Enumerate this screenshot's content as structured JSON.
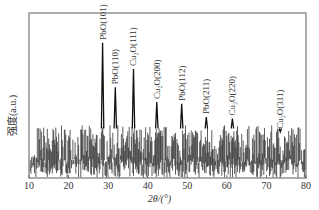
{
  "chart_data": {
    "type": "line",
    "title": "",
    "xlabel": "2θ/(°)",
    "ylabel": "强度(a.u.)",
    "xlim": [
      10,
      80
    ],
    "x_ticks": [
      10,
      20,
      30,
      40,
      50,
      60,
      70,
      80
    ],
    "y_ticks": [],
    "grid": false,
    "legend": "none",
    "series": [
      {
        "name": "XRD pattern",
        "color": "#1a1a1a"
      }
    ],
    "peaks": [
      {
        "label": "PbO(101)",
        "x": 28.6,
        "rel_intensity": 0.82
      },
      {
        "label": "PbO(110)",
        "x": 31.8,
        "rel_intensity": 0.55
      },
      {
        "label": "Cu2O(111)",
        "x": 36.4,
        "rel_intensity": 0.66
      },
      {
        "label": "Cu2O(200)",
        "x": 42.3,
        "rel_intensity": 0.46
      },
      {
        "label": "PbO(112)",
        "x": 48.6,
        "rel_intensity": 0.45
      },
      {
        "label": "PbO(211)",
        "x": 54.8,
        "rel_intensity": 0.37
      },
      {
        "label": "Cu2O(220)",
        "x": 61.4,
        "rel_intensity": 0.36
      },
      {
        "label": "Cu2O(311)",
        "x": 73.5,
        "rel_intensity": 0.28
      }
    ],
    "noise_band": {
      "min_rel": 0.0,
      "max_rel": 0.32
    }
  },
  "axis": {
    "xlabel_text": "2θ/(°)",
    "ylabel_text": "强度(a.u.)"
  }
}
